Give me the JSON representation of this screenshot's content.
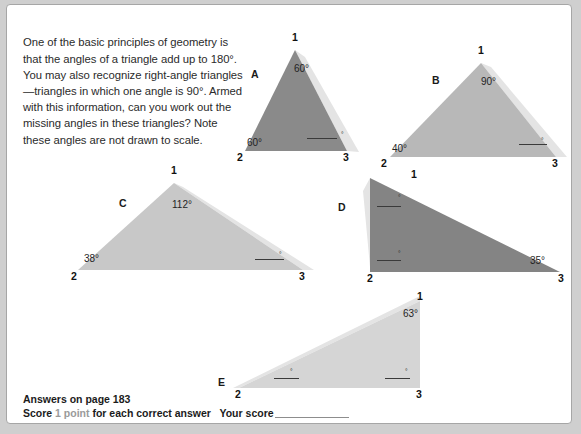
{
  "intro": {
    "text": "One of the basic principles of geometry is that the angles of a triangle add up to 180°. You may also recognize right-angle triangles—triangles in which one angle is 90°. Armed with this information, can you work out the missing angles in these triangles? Note these angles are not drawn to scale."
  },
  "colors": {
    "page_background": "#ffffff",
    "outer_background": "#cfcfcf",
    "border": "#a6a6a6",
    "triangle_a_fill": "#8a8a8a",
    "triangle_b_fill": "#b8b8b8",
    "triangle_c_fill": "#c8c8c8",
    "triangle_d_fill": "#848484",
    "triangle_e_fill": "#d5d5d5",
    "shadow_fill": "#e4e4e4",
    "text": "#1f1f1f",
    "muted_text": "#9a9a9a"
  },
  "figures": [
    {
      "id": "a",
      "label": "A",
      "fill": "#8a8a8a",
      "points": "288,45 238,146 340,146",
      "shadow": "298,52 352,147 340,146 288,45",
      "label_pos": {
        "left": 244,
        "top": 63
      },
      "vertices": [
        {
          "name": "1",
          "left": 285,
          "top": 26
        },
        {
          "name": "2",
          "left": 230,
          "top": 146
        },
        {
          "name": "3",
          "left": 336,
          "top": 146
        }
      ],
      "angles": [
        {
          "value": "60°",
          "left": 287,
          "top": 58
        },
        {
          "value": "60°",
          "left": 240,
          "top": 132
        }
      ],
      "blanks": [
        {
          "left": 300,
          "top": 132,
          "width": 30,
          "deg_left": 334,
          "deg_top": 127
        }
      ]
    },
    {
      "id": "b",
      "label": "B",
      "fill": "#b8b8b8",
      "points": "474,58 383,152 549,152",
      "shadow": "484,62 560,152 549,152 474,58",
      "label_pos": {
        "left": 425,
        "top": 69
      },
      "vertices": [
        {
          "name": "1",
          "left": 471,
          "top": 39
        },
        {
          "name": "2",
          "left": 374,
          "top": 152
        },
        {
          "name": "3",
          "left": 545,
          "top": 152
        }
      ],
      "angles": [
        {
          "value": "90°",
          "left": 474,
          "top": 71
        },
        {
          "value": "40°",
          "left": 385,
          "top": 138
        }
      ],
      "blanks": [
        {
          "left": 512,
          "top": 138,
          "width": 28,
          "deg_left": 534,
          "deg_top": 133
        }
      ]
    },
    {
      "id": "c",
      "label": "C",
      "fill": "#c8c8c8",
      "points": "167,178 71,265 296,265",
      "shadow": "176,182 307,265 296,265 167,178",
      "label_pos": {
        "left": 112,
        "top": 192
      },
      "vertices": [
        {
          "name": "1",
          "left": 164,
          "top": 159
        },
        {
          "name": "2",
          "left": 64,
          "top": 265
        },
        {
          "name": "3",
          "left": 292,
          "top": 265
        }
      ],
      "angles": [
        {
          "value": "112°",
          "left": 165,
          "top": 194
        },
        {
          "value": "38°",
          "left": 77,
          "top": 248
        }
      ],
      "blanks": [
        {
          "left": 248,
          "top": 253,
          "width": 29,
          "deg_left": 272,
          "deg_top": 247
        }
      ]
    },
    {
      "id": "d",
      "label": "D",
      "fill": "#848484",
      "points": "363,173 363,267 553,267",
      "shadow": "356,186 363,262 363,173",
      "label_pos": {
        "left": 331,
        "top": 196
      },
      "vertices": [
        {
          "name": "1",
          "left": 404,
          "top": 163
        },
        {
          "name": "2",
          "left": 360,
          "top": 267
        },
        {
          "name": "3",
          "left": 551,
          "top": 267
        }
      ],
      "angles": [
        {
          "value": "35°",
          "left": 523,
          "top": 250
        }
      ],
      "blanks": [
        {
          "left": 370,
          "top": 200,
          "width": 24,
          "deg_left": 391,
          "deg_top": 190
        },
        {
          "left": 370,
          "top": 254,
          "width": 24,
          "deg_left": 391,
          "deg_top": 246
        }
      ]
    },
    {
      "id": "e",
      "label": "E",
      "fill": "#d5d5d5",
      "points": "413,296 232,383 413,383",
      "shadow": "413,291 226,383 232,383 413,296",
      "label_pos": {
        "left": 211,
        "top": 371
      },
      "vertices": [
        {
          "name": "1",
          "left": 410,
          "top": 285
        },
        {
          "name": "2",
          "left": 228,
          "top": 383
        },
        {
          "name": "3",
          "left": 409,
          "top": 383
        }
      ],
      "angles": [
        {
          "value": "63°",
          "left": 396,
          "top": 303
        }
      ],
      "blanks": [
        {
          "left": 267,
          "top": 372,
          "width": 25,
          "deg_left": 283,
          "deg_top": 364
        },
        {
          "left": 378,
          "top": 372,
          "width": 25,
          "deg_left": 398,
          "deg_top": 364
        }
      ]
    }
  ],
  "footer": {
    "answers_line": "Answers on page 183",
    "score_prefix": "Score",
    "score_points": "1 point",
    "score_suffix": "for each correct answer",
    "your_score_label": "Your score"
  }
}
